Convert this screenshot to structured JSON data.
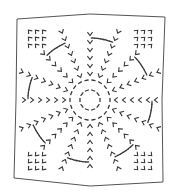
{
  "image": {
    "description": "Radial stitch pattern drawing in a slightly skewed square frame",
    "width": 179,
    "height": 192,
    "background": "#ffffff",
    "ink_color": "#3a3a3a",
    "frame": {
      "points": [
        [
          17,
          19
        ],
        [
          90,
          14
        ],
        [
          165,
          17
        ],
        [
          162,
          100
        ],
        [
          163,
          182
        ],
        [
          90,
          186
        ],
        [
          14,
          178
        ],
        [
          16,
          100
        ]
      ],
      "stroke": "#555555"
    },
    "center": [
      90,
      100
    ],
    "spokes": 16,
    "rings": [
      {
        "radius": 10,
        "marks": 10
      },
      {
        "radius": 20,
        "marks": 18
      },
      {
        "radius": 58,
        "marks": 0
      }
    ]
  }
}
